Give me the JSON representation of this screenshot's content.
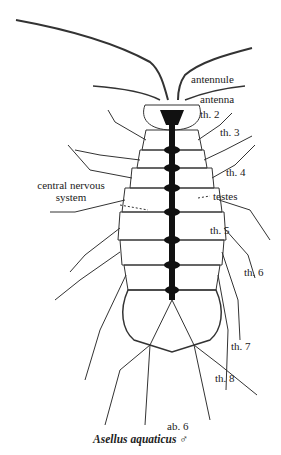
{
  "figure": {
    "caption": "Asellus aquaticus ♂",
    "labels": {
      "antennule": "antennule",
      "antenna": "antenna",
      "th2": "th. 2",
      "th3": "th. 3",
      "th4": "th. 4",
      "cns": "central nervous\nsystem",
      "testes": "testes",
      "th5": "th. 5",
      "th6": "th. 6",
      "th7": "th. 7",
      "th8": "th. 8",
      "ab6": "ab. 6"
    }
  }
}
